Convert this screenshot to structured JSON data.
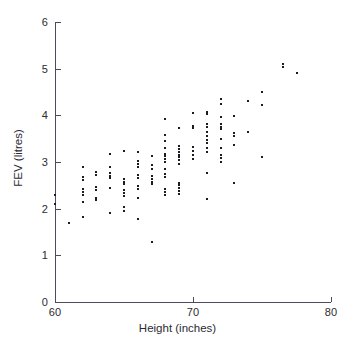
{
  "chart_data": {
    "type": "scatter",
    "title": "",
    "xlabel": "Height (inches)",
    "ylabel": "FEV (litres)",
    "xlim": [
      60,
      80
    ],
    "ylim": [
      0,
      6
    ],
    "xticks": [
      60,
      70,
      80
    ],
    "yticks": [
      0,
      1,
      2,
      3,
      4,
      5,
      6
    ],
    "xtick_labels": [
      "60",
      "70",
      "80"
    ],
    "ytick_labels": [
      "0",
      "1",
      "2",
      "3",
      "4",
      "5",
      "6"
    ],
    "grid": false,
    "legend": null,
    "marker": "dot",
    "marker_color": "#1b1b22",
    "axis_color": "#4d4d5a",
    "background": "#ffffff",
    "n_points": 154,
    "points": [
      [
        60.0,
        2.3
      ],
      [
        60.0,
        2.1
      ],
      [
        61.0,
        1.7
      ],
      [
        62.0,
        2.9
      ],
      [
        62.0,
        2.68
      ],
      [
        62.0,
        2.62
      ],
      [
        62.0,
        2.42
      ],
      [
        62.0,
        2.36
      ],
      [
        62.0,
        2.3
      ],
      [
        62.0,
        2.15
      ],
      [
        62.0,
        1.82
      ],
      [
        63.0,
        2.78
      ],
      [
        63.0,
        2.72
      ],
      [
        63.0,
        2.46
      ],
      [
        63.0,
        2.4
      ],
      [
        63.0,
        2.22
      ],
      [
        63.0,
        2.18
      ],
      [
        64.0,
        3.18
      ],
      [
        64.0,
        2.9
      ],
      [
        64.0,
        2.76
      ],
      [
        64.0,
        2.7
      ],
      [
        64.0,
        2.66
      ],
      [
        64.0,
        2.44
      ],
      [
        64.0,
        1.9
      ],
      [
        65.0,
        3.24
      ],
      [
        65.0,
        2.64
      ],
      [
        65.0,
        2.58
      ],
      [
        65.0,
        2.52
      ],
      [
        65.0,
        2.4
      ],
      [
        65.0,
        2.34
      ],
      [
        65.0,
        2.28
      ],
      [
        65.0,
        2.04
      ],
      [
        65.0,
        1.96
      ],
      [
        66.0,
        3.22
      ],
      [
        66.0,
        3.02
      ],
      [
        66.0,
        2.96
      ],
      [
        66.0,
        2.9
      ],
      [
        66.0,
        2.72
      ],
      [
        66.0,
        2.66
      ],
      [
        66.0,
        2.48
      ],
      [
        66.0,
        2.42
      ],
      [
        66.0,
        2.22
      ],
      [
        66.0,
        1.78
      ],
      [
        67.0,
        3.12
      ],
      [
        67.0,
        2.94
      ],
      [
        67.0,
        2.86
      ],
      [
        67.0,
        2.7
      ],
      [
        67.0,
        2.64
      ],
      [
        67.0,
        2.58
      ],
      [
        67.0,
        2.52
      ],
      [
        67.0,
        1.28
      ],
      [
        68.0,
        3.92
      ],
      [
        68.0,
        3.58
      ],
      [
        68.0,
        3.44
      ],
      [
        68.0,
        3.3
      ],
      [
        68.0,
        3.18
      ],
      [
        68.0,
        3.12
      ],
      [
        68.0,
        3.06
      ],
      [
        68.0,
        3.0
      ],
      [
        68.0,
        2.86
      ],
      [
        68.0,
        2.74
      ],
      [
        68.0,
        2.68
      ],
      [
        68.0,
        2.42
      ],
      [
        68.0,
        2.36
      ],
      [
        68.0,
        2.3
      ],
      [
        69.0,
        3.72
      ],
      [
        69.0,
        3.34
      ],
      [
        69.0,
        3.28
      ],
      [
        69.0,
        3.22
      ],
      [
        69.0,
        3.16
      ],
      [
        69.0,
        3.1
      ],
      [
        69.0,
        3.04
      ],
      [
        69.0,
        2.96
      ],
      [
        69.0,
        2.56
      ],
      [
        69.0,
        2.5
      ],
      [
        69.0,
        2.44
      ],
      [
        69.0,
        2.38
      ],
      [
        69.0,
        2.32
      ],
      [
        70.0,
        4.04
      ],
      [
        70.0,
        3.78
      ],
      [
        70.0,
        3.72
      ],
      [
        70.0,
        3.32
      ],
      [
        70.0,
        3.24
      ],
      [
        70.0,
        3.16
      ],
      [
        70.0,
        3.06
      ],
      [
        71.0,
        4.08
      ],
      [
        71.0,
        4.02
      ],
      [
        71.0,
        3.82
      ],
      [
        71.0,
        3.74
      ],
      [
        71.0,
        3.64
      ],
      [
        71.0,
        3.56
      ],
      [
        71.0,
        3.48
      ],
      [
        71.0,
        3.4
      ],
      [
        71.0,
        3.3
      ],
      [
        71.0,
        3.22
      ],
      [
        71.0,
        2.76
      ],
      [
        71.0,
        2.2
      ],
      [
        72.0,
        4.34
      ],
      [
        72.0,
        4.24
      ],
      [
        72.0,
        3.96
      ],
      [
        72.0,
        3.82
      ],
      [
        72.0,
        3.76
      ],
      [
        72.0,
        3.7
      ],
      [
        72.0,
        3.5
      ],
      [
        72.0,
        3.3
      ],
      [
        72.0,
        3.16
      ],
      [
        72.0,
        3.08
      ],
      [
        72.0,
        3.0
      ],
      [
        73.0,
        3.98
      ],
      [
        73.0,
        3.62
      ],
      [
        73.0,
        3.56
      ],
      [
        73.0,
        3.36
      ],
      [
        73.0,
        2.56
      ],
      [
        74.0,
        4.3
      ],
      [
        74.0,
        3.64
      ],
      [
        75.0,
        4.5
      ],
      [
        75.0,
        4.22
      ],
      [
        75.0,
        3.1
      ],
      [
        76.5,
        5.1
      ],
      [
        76.5,
        5.04
      ],
      [
        77.5,
        4.9
      ]
    ]
  },
  "figure": {
    "axis_line_width": "1px",
    "tick_length": "5px"
  }
}
